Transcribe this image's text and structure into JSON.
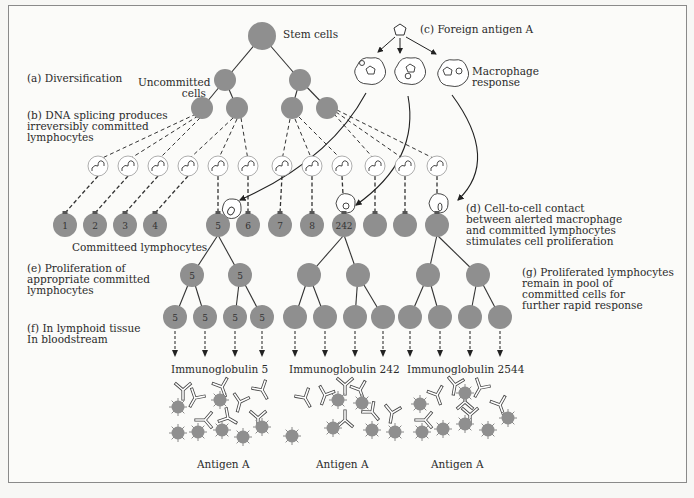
{
  "labels": {
    "stem_cells": "Stem cells",
    "foreign_antigen": "(c) Foreign antigen A",
    "diversification": "(a) Diversification",
    "uncommitted_cells": "Uncommitted\ncells",
    "dna_splicing": "(b) DNA splicing produces\nirreversibly committed\nlymphocytes",
    "macrophage_response": "Macrophage\nresponse",
    "committed_lymphocytes": "Committeed lymphocytes",
    "cell_contact": "(d) Cell-to-cell contact\nbetween alerted macrophage\nand committed lymphocytes\nstimulates cell proliferation",
    "proliferation": "(e) Proliferation of\nappropriate committed\nlymphocytes",
    "proliferated_pool": "(g) Proliferated lymphocytes\nremain in pool of\ncommitted cells for\nfurther rapid response",
    "lymphoid_tissue": "(f) In lymphoid tissue\nIn bloodstream",
    "ig_5": "Immunoglobulin 5",
    "ig_242": "Immunoglobulin 242",
    "ig_2544": "Immunoglobulin 2544",
    "antigen_a_1": "Antigen A",
    "antigen_a_2": "Antigen A",
    "antigen_a_3": "Antigen A"
  },
  "committed_cells": [
    "1",
    "2",
    "3",
    "4",
    "5",
    "6",
    "7",
    "8",
    "242",
    "",
    "",
    ""
  ],
  "proliferation_clones": [
    {
      "id": "5",
      "level1": [
        "5",
        "5"
      ],
      "level2": [
        "5",
        "5",
        "5",
        "5"
      ]
    },
    {
      "id": "242",
      "level1": [
        "",
        ""
      ],
      "level2": [
        "",
        "",
        "",
        ""
      ]
    },
    {
      "id": "2544",
      "level1": [
        "",
        ""
      ],
      "level2": [
        "",
        "",
        "",
        ""
      ]
    }
  ],
  "colors": {
    "cell_fill": "#8f8f8f",
    "line": "#333333",
    "frame": "#8a8a8a"
  }
}
